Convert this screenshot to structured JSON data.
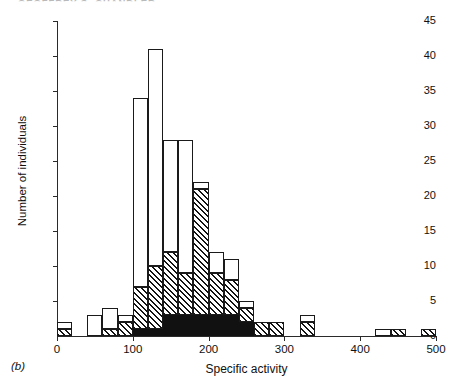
{
  "running_head": "GEOFFREY S. CHANDLER",
  "panel_label": "(b)",
  "chart_data": {
    "type": "bar",
    "title": "",
    "subtitle": "",
    "xlabel": "Specific activity",
    "ylabel": "Number of individuals",
    "xlim": [
      0,
      500
    ],
    "ylim": [
      0,
      45
    ],
    "xticks": [
      0,
      100,
      200,
      300,
      400,
      500
    ],
    "xtick_labels": [
      "0",
      "100",
      "200",
      "300",
      "400",
      "500"
    ],
    "yticks": [
      0,
      5,
      10,
      15,
      20,
      25,
      30,
      35,
      40,
      45
    ],
    "ytick_labels": [
      "0",
      "5",
      "10",
      "15",
      "20",
      "25",
      "30",
      "35",
      "40",
      "45"
    ],
    "grid": false,
    "legend": "none",
    "bin_width": 20,
    "stack_order": [
      "black",
      "hatched",
      "white"
    ],
    "series": [
      {
        "name": "black",
        "values": [
          0,
          0,
          0,
          0,
          0,
          1,
          1,
          3,
          3,
          3,
          3,
          3,
          2,
          0,
          0,
          0,
          0,
          0,
          0,
          0,
          0,
          0,
          0,
          0,
          0
        ]
      },
      {
        "name": "hatched",
        "values": [
          1,
          0,
          0,
          1,
          2,
          6,
          9,
          9,
          6,
          18,
          6,
          5,
          2,
          2,
          2,
          0,
          2,
          0,
          0,
          0,
          0,
          1,
          0,
          1,
          0
        ]
      },
      {
        "name": "white",
        "values": [
          1,
          0,
          3,
          3,
          1,
          27,
          31,
          16,
          19,
          1,
          3,
          3,
          1,
          0,
          0,
          0,
          1,
          0,
          0,
          0,
          1,
          0,
          0,
          0,
          0
        ]
      }
    ],
    "bins": [
      {
        "x0": 0,
        "x1": 20,
        "black": 0,
        "hatched": 1,
        "white": 1,
        "total": 2
      },
      {
        "x0": 20,
        "x1": 40,
        "black": 0,
        "hatched": 0,
        "white": 0,
        "total": 0
      },
      {
        "x0": 40,
        "x1": 60,
        "black": 0,
        "hatched": 0,
        "white": 3,
        "total": 3
      },
      {
        "x0": 60,
        "x1": 80,
        "black": 0,
        "hatched": 1,
        "white": 3,
        "total": 4
      },
      {
        "x0": 80,
        "x1": 100,
        "black": 0,
        "hatched": 2,
        "white": 1,
        "total": 3
      },
      {
        "x0": 100,
        "x1": 120,
        "black": 1,
        "hatched": 6,
        "white": 27,
        "total": 34
      },
      {
        "x0": 120,
        "x1": 140,
        "black": 1,
        "hatched": 9,
        "white": 31,
        "total": 41
      },
      {
        "x0": 140,
        "x1": 160,
        "black": 3,
        "hatched": 9,
        "white": 16,
        "total": 28
      },
      {
        "x0": 160,
        "x1": 180,
        "black": 3,
        "hatched": 6,
        "white": 19,
        "total": 28
      },
      {
        "x0": 180,
        "x1": 200,
        "black": 3,
        "hatched": 18,
        "white": 1,
        "total": 22
      },
      {
        "x0": 200,
        "x1": 220,
        "black": 3,
        "hatched": 6,
        "white": 3,
        "total": 12
      },
      {
        "x0": 220,
        "x1": 240,
        "black": 3,
        "hatched": 5,
        "white": 3,
        "total": 11
      },
      {
        "x0": 240,
        "x1": 260,
        "black": 2,
        "hatched": 2,
        "white": 1,
        "total": 5
      },
      {
        "x0": 260,
        "x1": 280,
        "black": 0,
        "hatched": 2,
        "white": 0,
        "total": 2
      },
      {
        "x0": 280,
        "x1": 300,
        "black": 0,
        "hatched": 2,
        "white": 0,
        "total": 2
      },
      {
        "x0": 300,
        "x1": 320,
        "black": 0,
        "hatched": 0,
        "white": 0,
        "total": 0
      },
      {
        "x0": 320,
        "x1": 340,
        "black": 0,
        "hatched": 2,
        "white": 1,
        "total": 3
      },
      {
        "x0": 340,
        "x1": 360,
        "black": 0,
        "hatched": 0,
        "white": 0,
        "total": 0
      },
      {
        "x0": 360,
        "x1": 380,
        "black": 0,
        "hatched": 0,
        "white": 0,
        "total": 0
      },
      {
        "x0": 380,
        "x1": 400,
        "black": 0,
        "hatched": 0,
        "white": 0,
        "total": 0
      },
      {
        "x0": 400,
        "x1": 420,
        "black": 0,
        "hatched": 0,
        "white": 0,
        "total": 0
      },
      {
        "x0": 420,
        "x1": 440,
        "black": 0,
        "hatched": 0,
        "white": 1,
        "total": 1
      },
      {
        "x0": 440,
        "x1": 460,
        "black": 0,
        "hatched": 1,
        "white": 0,
        "total": 1
      },
      {
        "x0": 460,
        "x1": 480,
        "black": 0,
        "hatched": 0,
        "white": 0,
        "total": 0
      },
      {
        "x0": 480,
        "x1": 500,
        "black": 0,
        "hatched": 1,
        "white": 0,
        "total": 1
      }
    ]
  }
}
